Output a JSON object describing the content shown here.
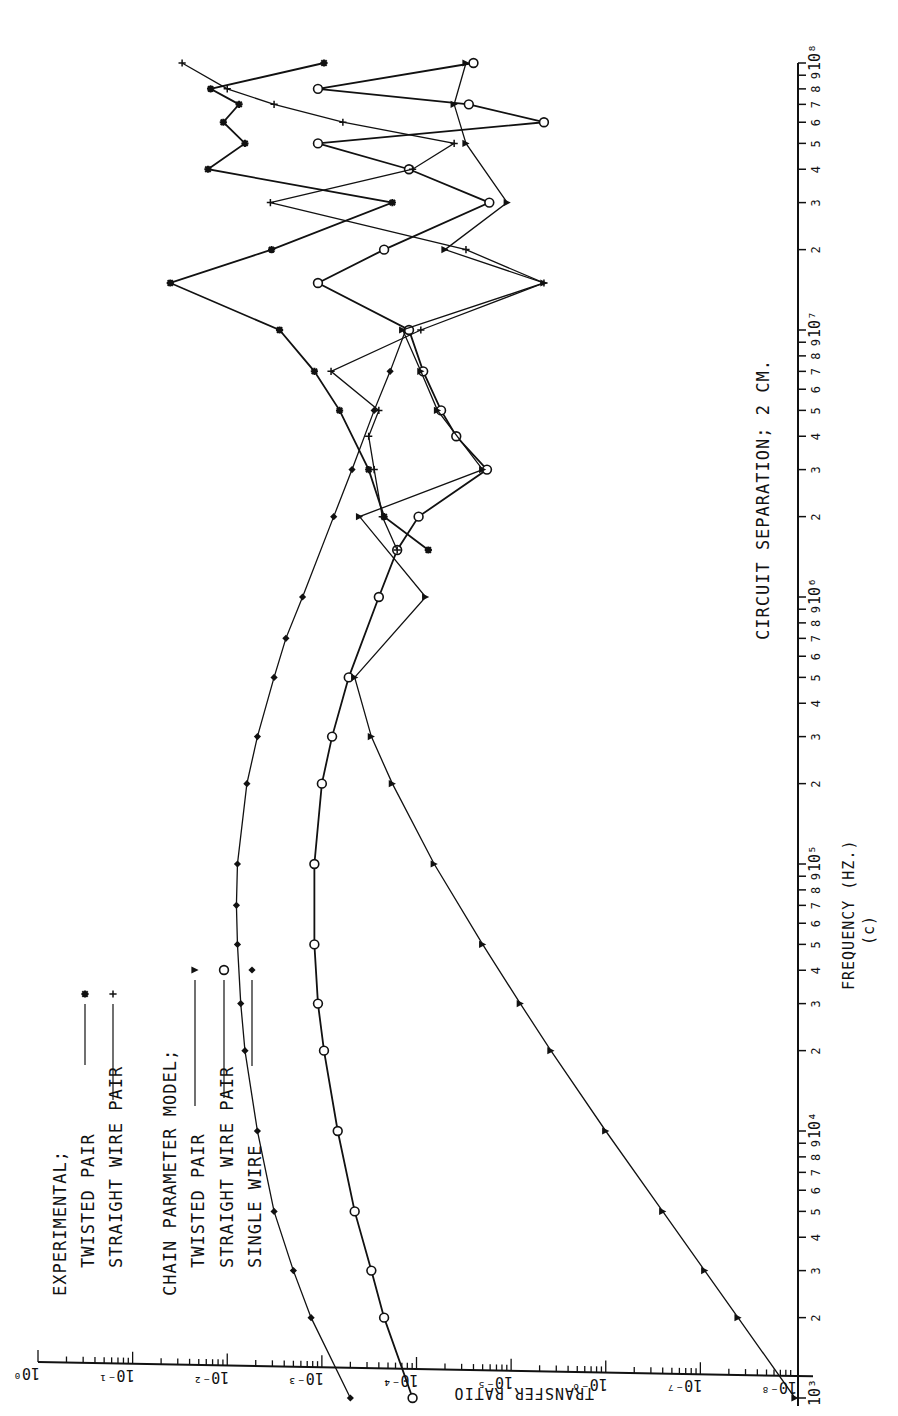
{
  "figure": {
    "caption": "(c)",
    "annotation": "CIRCUIT SEPARATION; 2 CM.",
    "xlabel": "FREQUENCY (HZ.)",
    "ylabel": "TRANSFER RATIO",
    "legend": {
      "group1_title": "EXPERIMENTAL;",
      "group1_items": [
        {
          "label": "TWISTED PAIR",
          "marker": "asterisk"
        },
        {
          "label": "STRAIGHT WIRE PAIR",
          "marker": "plus"
        }
      ],
      "group2_title": "CHAIN PARAMETER MODEL;",
      "group2_items": [
        {
          "label": "TWISTED PAIR",
          "marker": "triangle"
        },
        {
          "label": "STRAIGHT WIRE PAIR",
          "marker": "circle"
        },
        {
          "label": "SINGLE WIRE",
          "marker": "diamond"
        }
      ]
    },
    "freq_ticks": [
      "10³",
      "2",
      "3",
      "4",
      "5",
      "6",
      "7",
      "8",
      "9",
      "10⁴",
      "2",
      "3",
      "4",
      "5",
      "6",
      "7",
      "8",
      "9",
      "10⁵",
      "2",
      "3",
      "4",
      "5",
      "6",
      "7",
      "8",
      "9",
      "10⁶",
      "2",
      "3",
      "4",
      "5",
      "6",
      "7",
      "8",
      "9",
      "10⁷",
      "2",
      "3",
      "4",
      "5",
      "6",
      "7",
      "8",
      "9",
      "10⁸"
    ],
    "ratio_ticks": [
      "10⁰",
      "10⁻¹",
      "10⁻²",
      "10⁻³",
      "10⁻⁴",
      "10⁻⁵",
      "10⁻⁶",
      "10⁻⁷",
      "10⁻⁸"
    ]
  },
  "chart_data": {
    "type": "line",
    "title": "CIRCUIT SEPARATION; 2 CM.",
    "caption": "(c)",
    "xlabel": "FREQUENCY (HZ.)",
    "ylabel": "TRANSFER RATIO",
    "x_scale": "log",
    "y_scale": "log",
    "xlim": [
      1000,
      100000000
    ],
    "ylim": [
      1e-08,
      1
    ],
    "orientation": "rotated 90° counter-clockwise (frequency axis vertical on right, transfer ratio axis horizontal at bottom)",
    "grid": false,
    "legend_position": "upper-left (rotated)",
    "series": [
      {
        "name": "Chain parameter model — Single wire",
        "marker": "diamond",
        "x": [
          1000,
          2000,
          3000,
          5000,
          10000,
          20000,
          30000,
          50000,
          70000,
          100000,
          200000,
          300000,
          500000,
          700000,
          1000000,
          2000000,
          3000000,
          5000000,
          7000000,
          10000000
        ],
        "y": [
          0.0005,
          0.0013,
          0.002,
          0.0032,
          0.0048,
          0.0065,
          0.0072,
          0.0078,
          0.008,
          0.0078,
          0.0062,
          0.0048,
          0.0032,
          0.0024,
          0.0016,
          0.00075,
          0.00048,
          0.00028,
          0.00019,
          0.00013
        ]
      },
      {
        "name": "Chain parameter model — Straight wire pair",
        "marker": "circle",
        "x": [
          1000,
          2000,
          3000,
          5000,
          10000,
          20000,
          30000,
          50000,
          100000,
          200000,
          300000,
          500000,
          1000000,
          1500000,
          2000000,
          3000000,
          4000000,
          5000000,
          7000000,
          10000000,
          15000000,
          20000000,
          30000000,
          40000000,
          50000000,
          60000000,
          70000000,
          80000000,
          100000000
        ],
        "y": [
          0.00011,
          0.00022,
          0.0003,
          0.00045,
          0.00068,
          0.00095,
          0.0011,
          0.0012,
          0.0012,
          0.001,
          0.00078,
          0.00052,
          0.00025,
          0.00016,
          9.5e-05,
          1.8e-05,
          3.8e-05,
          5.5e-05,
          8.5e-05,
          0.00012,
          0.0011,
          0.00022,
          1.7e-05,
          0.00012,
          0.0011,
          4.5e-06,
          2.8e-05,
          0.0011,
          2.5e-05
        ]
      },
      {
        "name": "Chain parameter model — Twisted pair",
        "marker": "triangle",
        "x": [
          1000,
          2000,
          3000,
          5000,
          10000,
          20000,
          30000,
          50000,
          100000,
          200000,
          300000,
          500000,
          1000000,
          2000000,
          3000000,
          5000000,
          7000000,
          10000000,
          15000000,
          20000000,
          30000000,
          50000000,
          70000000,
          100000000
        ],
        "y": [
          1e-08,
          4e-08,
          9e-08,
          2.5e-07,
          1e-06,
          3.8e-06,
          8e-06,
          2e-05,
          6.5e-05,
          0.00018,
          0.0003,
          0.00045,
          8e-05,
          0.0004,
          2e-05,
          6e-05,
          9e-05,
          0.00014,
          4.5e-06,
          5e-05,
          1.1e-05,
          3e-05,
          4e-05,
          3e-05
        ]
      },
      {
        "name": "Experimental — Twisted pair",
        "marker": "asterisk",
        "x": [
          1500000,
          2000000,
          3000000,
          5000000,
          7000000,
          10000000,
          15000000,
          20000000,
          30000000,
          40000000,
          50000000,
          60000000,
          70000000,
          80000000,
          100000000
        ],
        "y": [
          7.5e-05,
          0.00022,
          0.00032,
          0.00065,
          0.0012,
          0.0028,
          0.04,
          0.0034,
          0.00018,
          0.016,
          0.0065,
          0.011,
          0.0075,
          0.015,
          0.00095
        ]
      },
      {
        "name": "Experimental — Straight wire pair",
        "marker": "plus",
        "x": [
          1500000,
          2000000,
          3000000,
          4000000,
          5000000,
          7000000,
          10000000,
          15000000,
          20000000,
          30000000,
          40000000,
          50000000,
          60000000,
          70000000,
          80000000,
          100000000
        ],
        "y": [
          0.00016,
          0.00023,
          0.00028,
          0.00032,
          0.00025,
          0.0008,
          9e-05,
          4.5e-06,
          3e-05,
          0.0035,
          0.00011,
          4e-05,
          0.0006,
          0.0032,
          0.01,
          0.03
        ]
      }
    ]
  }
}
